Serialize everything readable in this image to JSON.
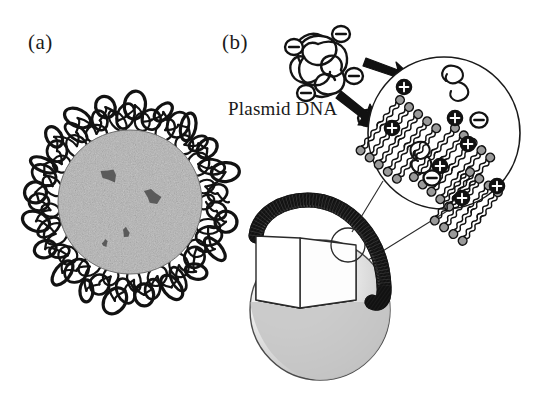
{
  "figure": {
    "type": "scientific-illustration",
    "background_color": "#ffffff",
    "ink_color": "#1a1a1a",
    "panels": [
      {
        "id": "a",
        "label": "(a)",
        "description": "Electron-micrograph-style grainy grey spherical particle surrounded by a dense corona of tangled DNA loops",
        "center": {
          "x": 130,
          "y": 202
        },
        "core_radius": 72,
        "core_fill": "#b4b4b4",
        "corona_stroke": "#111111",
        "dark_spots": [
          {
            "x": 109,
            "y": 175,
            "r": 9
          },
          {
            "x": 152,
            "y": 196,
            "r": 9
          },
          {
            "x": 126,
            "y": 232,
            "r": 5
          },
          {
            "x": 105,
            "y": 243,
            "r": 4
          }
        ]
      },
      {
        "id": "b",
        "label": "(b)",
        "description": "Schematic of plasmid DNA complexing with a cationic liposome; magnified inset shows lipid bilayer head groups with positive charges binding negatively charged DNA",
        "plasmid": {
          "caption": "Plasmid DNA",
          "charge_symbol": "minus-circle",
          "charge_count": 5,
          "charge_positions": [
            {
              "x": 294,
              "y": 47
            },
            {
              "x": 341,
              "y": 34
            },
            {
              "x": 354,
              "y": 76
            },
            {
              "x": 306,
              "y": 93
            },
            {
              "x": 367,
              "y": 118
            }
          ]
        },
        "arrows": [
          {
            "name": "arrow-upper",
            "from": {
              "x": 368,
              "y": 62
            },
            "to": {
              "x": 406,
              "y": 77
            }
          },
          {
            "name": "arrow-lower",
            "from": {
              "x": 345,
              "y": 95
            },
            "to": {
              "x": 378,
              "y": 128
            }
          }
        ],
        "inset_circle": {
          "center": {
            "x": 444,
            "y": 133
          },
          "radius": 76,
          "stroke": "#1a1a1a",
          "contents": "cationic lipid bilayer patches with DNA strands",
          "positive_charge_symbol": "plus-circle",
          "negative_charge_symbol": "minus-circle",
          "positive_charge_count": 6,
          "negative_charge_count": 3,
          "lipid_head_fill": "#9a9a9a",
          "lipid_tail_style": "wavy"
        },
        "liposome": {
          "center": {
            "x": 320,
            "y": 310
          },
          "radius": 70,
          "surface_fill_light": "#f2f2f2",
          "surface_fill_dark": "#b5b5b5",
          "membrane_fill": "#121212",
          "cutaway": "wedge-quadrant",
          "magnifier_marker": {
            "x": 348,
            "y": 245,
            "r": 17
          }
        },
        "leader_lines": [
          {
            "from": {
              "x": 352,
              "y": 230
            },
            "to": {
              "x": 385,
              "y": 183
            }
          },
          {
            "from": {
              "x": 362,
              "y": 262
            },
            "to": {
              "x": 450,
              "y": 209
            }
          }
        ]
      }
    ]
  }
}
